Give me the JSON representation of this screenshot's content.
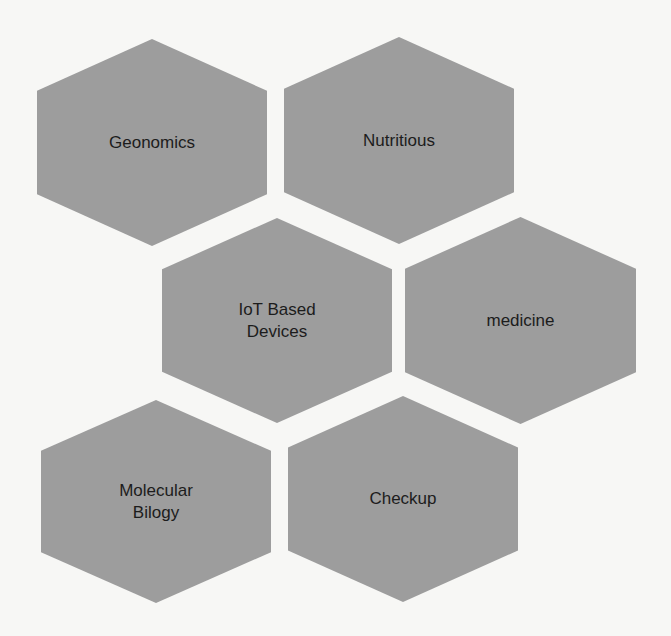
{
  "diagram": {
    "type": "hexagon-cluster",
    "fill_color": "#9d9d9d",
    "background_color": "#f7f7f5",
    "text_color": "#1c1c1c",
    "nodes": [
      {
        "id": "geonomics",
        "label": "Geonomics"
      },
      {
        "id": "nutritious",
        "label": "Nutritious"
      },
      {
        "id": "iot",
        "label": "IoT Based\nDevices"
      },
      {
        "id": "medicine",
        "label": "medicine"
      },
      {
        "id": "molecular",
        "label": "Molecular\nBilogy"
      },
      {
        "id": "checkup",
        "label": "Checkup"
      }
    ]
  }
}
